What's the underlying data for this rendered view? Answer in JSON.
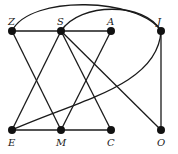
{
  "graph": {
    "nodes": [
      {
        "id": "Z",
        "label": "Z",
        "x": 12,
        "y": 31,
        "label_pos": "above"
      },
      {
        "id": "S",
        "label": "S",
        "x": 61,
        "y": 31,
        "label_pos": "above"
      },
      {
        "id": "A",
        "label": "A",
        "x": 111,
        "y": 31,
        "label_pos": "above"
      },
      {
        "id": "J",
        "label": "J",
        "x": 161,
        "y": 31,
        "label_pos": "above"
      },
      {
        "id": "E",
        "label": "E",
        "x": 12,
        "y": 130,
        "label_pos": "below"
      },
      {
        "id": "M",
        "label": "M",
        "x": 61,
        "y": 130,
        "label_pos": "below"
      },
      {
        "id": "C",
        "label": "C",
        "x": 111,
        "y": 130,
        "label_pos": "below"
      },
      {
        "id": "O",
        "label": "O",
        "x": 161,
        "y": 130,
        "label_pos": "below"
      }
    ],
    "edges": [
      {
        "from": "Z",
        "to": "S",
        "type": "straight"
      },
      {
        "from": "S",
        "to": "A",
        "type": "straight"
      },
      {
        "from": "E",
        "to": "M",
        "type": "straight"
      },
      {
        "from": "M",
        "to": "C",
        "type": "straight"
      },
      {
        "from": "Z",
        "to": "M",
        "type": "straight"
      },
      {
        "from": "S",
        "to": "E",
        "type": "straight"
      },
      {
        "from": "S",
        "to": "C",
        "type": "straight"
      },
      {
        "from": "S",
        "to": "O",
        "type": "straight"
      },
      {
        "from": "A",
        "to": "M",
        "type": "straight"
      },
      {
        "from": "J",
        "to": "O",
        "type": "straight"
      },
      {
        "from": "J",
        "to": "E",
        "type": "curve"
      },
      {
        "from": "Z",
        "to": "J",
        "type": "arc"
      },
      {
        "from": "S",
        "to": "J",
        "type": "arc"
      }
    ],
    "style": {
      "edge_color": "#1a1a1a",
      "node_color": "#111111",
      "background": "#ffffff"
    }
  }
}
